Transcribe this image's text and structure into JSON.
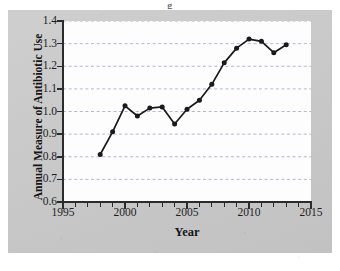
{
  "figure": {
    "title_sliver": "g",
    "panel_color": "#c9c9c9",
    "plot_bg_color": "#fdfdfd",
    "line_color": "#1a1a1a",
    "gridline_color": "#9aa7c4"
  },
  "chart_data": {
    "type": "line",
    "title": "",
    "xlabel": "Year",
    "ylabel": "Annual Measure of Antibiotic Use",
    "xlim": [
      1995,
      2015
    ],
    "ylim": [
      0.6,
      1.4
    ],
    "xticks": [
      1995,
      2000,
      2005,
      2010,
      2015
    ],
    "xtick_labels": [
      "1995",
      "2000",
      "2005",
      "2010",
      "2015"
    ],
    "xminor_step": 1,
    "yticks": [
      0.6,
      0.7,
      0.8,
      0.9,
      1.0,
      1.1,
      1.2,
      1.3,
      1.4
    ],
    "ytick_labels": [
      "0.6",
      "0.7",
      "0.8",
      "0.9",
      "1.0",
      "1.1",
      "1.2",
      "1.3",
      "1.4"
    ],
    "grid": "horizontal-dashed",
    "legend": "none",
    "marker": "filled-circle",
    "x": [
      1998,
      1999,
      2000,
      2001,
      2002,
      2003,
      2004,
      2005,
      2006,
      2007,
      2008,
      2009,
      2010,
      2011,
      2012,
      2013
    ],
    "values": [
      0.81,
      0.91,
      1.025,
      0.98,
      1.015,
      1.02,
      0.945,
      1.01,
      1.05,
      1.12,
      1.215,
      1.28,
      1.32,
      1.31,
      1.26,
      1.295
    ],
    "series": [
      {
        "name": "Annual Measure of Antibiotic Use",
        "values": [
          0.81,
          0.91,
          1.025,
          0.98,
          1.015,
          1.02,
          0.945,
          1.01,
          1.05,
          1.12,
          1.215,
          1.28,
          1.32,
          1.31,
          1.26,
          1.295
        ]
      }
    ]
  }
}
